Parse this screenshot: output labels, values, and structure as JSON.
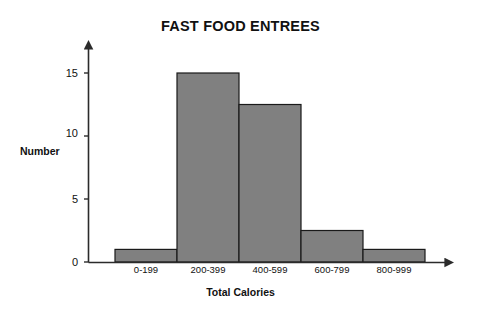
{
  "chart_data": {
    "type": "bar",
    "title": "FAST FOOD ENTREES",
    "xlabel": "Total Calories",
    "ylabel": "Number",
    "categories": [
      "0-199",
      "200-399",
      "400-599",
      "600-799",
      "800-999"
    ],
    "values": [
      1,
      15,
      12.5,
      2.5,
      1
    ],
    "ytick_labels": [
      "0",
      "5",
      "10",
      "15"
    ],
    "ytick_values": [
      0,
      5,
      10,
      15
    ],
    "ylim": [
      0,
      16.5
    ],
    "xlim_categories": 5,
    "grid": false,
    "legend": null,
    "bar_fill_color": "#808080",
    "bar_edge_color": "#1a1a1a",
    "axis_color": "#2b2b2b",
    "text_color": "#111111",
    "background_color": "#ffffff",
    "axis_arrows": true,
    "bars_contiguous": true
  },
  "axis": {
    "y_tick_0": "0",
    "y_tick_1": "5",
    "y_tick_2": "10",
    "y_tick_3": "15"
  },
  "categories_labels": {
    "c0": "0-199",
    "c1": "200-399",
    "c2": "400-599",
    "c3": "600-799",
    "c4": "800-999"
  }
}
